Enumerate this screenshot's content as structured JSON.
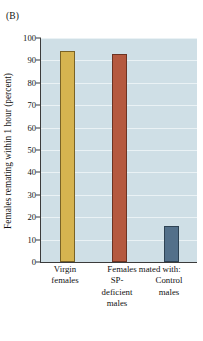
{
  "panel": {
    "label": "(B)"
  },
  "chart_data": {
    "type": "bar",
    "title": "",
    "subtitle": "",
    "xlabel": "",
    "ylabel": "Females remating within 1 hour (percent)",
    "ylim": [
      0,
      100
    ],
    "ytick_step": 10,
    "yticks": [
      "0",
      "10",
      "20",
      "30",
      "40",
      "50",
      "60",
      "70",
      "80",
      "90",
      "100"
    ],
    "grid": true,
    "grid_axis": "y",
    "legend": "none",
    "categories": [
      "Virgin females",
      "SP-deficient males",
      "Control males"
    ],
    "values": [
      94,
      93,
      16
    ],
    "bars": [
      {
        "category": "Virgin females",
        "label_lines": [
          "Virgin",
          "females"
        ],
        "value": 94,
        "fill": "#d6b450",
        "stroke": "#7a6326"
      },
      {
        "category": "SP-deficient males",
        "label_lines": [
          "SP-",
          "deficient",
          "males"
        ],
        "value": 93,
        "fill": "#b5593f",
        "stroke": "#6d3322"
      },
      {
        "category": "Control males",
        "label_lines": [
          "Control",
          "males"
        ],
        "value": 16,
        "fill": "#53708a",
        "stroke": "#2e4354"
      }
    ],
    "group_header": {
      "text": "Females mated with:",
      "covers": [
        "SP-deficient males",
        "Control males"
      ]
    },
    "plot_background": "#cfdfe6",
    "gridline_color": "#eaf2f5",
    "axis_color": "#3b3b3b"
  }
}
